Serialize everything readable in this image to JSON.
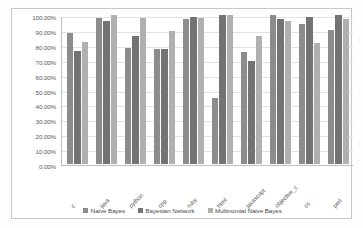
{
  "chart_data": {
    "type": "bar",
    "title": "",
    "xlabel": "",
    "ylabel": "",
    "ylim": [
      0,
      100
    ],
    "grid": true,
    "legend_position": "bottom",
    "y_ticks": [
      "0.00%",
      "10.00%",
      "20.00%",
      "30.00%",
      "40.00%",
      "50.00%",
      "60.00%",
      "70.00%",
      "80.00%",
      "90.00%",
      "100.00%"
    ],
    "y_tick_values": [
      0,
      10,
      20,
      30,
      40,
      50,
      60,
      70,
      80,
      90,
      100
    ],
    "categories": [
      "c",
      "java",
      "python",
      "cpp",
      "ruby",
      "html",
      "javascript",
      "objective_c",
      "cs",
      "perl"
    ],
    "series": [
      {
        "name": "Naive Bayes",
        "color": "#8c8c8c",
        "values": [
          88,
          98,
          78,
          77,
          97,
          44,
          75,
          100,
          94,
          90
        ]
      },
      {
        "name": "Bayesian Network",
        "color": "#737373",
        "values": [
          76,
          96,
          86,
          77,
          99,
          100,
          69,
          97,
          99,
          100
        ]
      },
      {
        "name": "Multinomial Naive Bayes",
        "color": "#b0b0b0",
        "values": [
          82,
          100,
          98,
          89,
          98,
          100,
          86,
          96,
          81,
          97
        ]
      }
    ]
  }
}
